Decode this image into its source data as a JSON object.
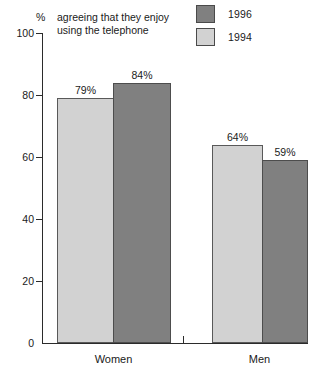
{
  "chart_data": {
    "type": "bar",
    "title": "",
    "caption": "agreeing that they enjoy using the telephone",
    "caption_line1": "agreeing that they enjoy",
    "caption_line2": "using the telephone",
    "unit_symbol": "%",
    "xlabel": "",
    "ylabel": "%",
    "ylim": [
      0,
      100
    ],
    "yticks": [
      0,
      20,
      40,
      60,
      80,
      100
    ],
    "ytick_labels": [
      "0",
      "20",
      "40",
      "60",
      "80",
      "100"
    ],
    "grid": false,
    "legend_position": "top-right",
    "categories": [
      "Women",
      "Men"
    ],
    "series": [
      {
        "name": "1994",
        "color": "#d2d2d2",
        "values": [
          79,
          64
        ],
        "labels": [
          "79%",
          "64%"
        ]
      },
      {
        "name": "1996",
        "color": "#808080",
        "values": [
          84,
          59
        ],
        "labels": [
          "84%",
          "59%"
        ]
      }
    ]
  },
  "legend": {
    "items": [
      {
        "label": "1996",
        "color": "#808080"
      },
      {
        "label": "1994",
        "color": "#d2d2d2"
      }
    ]
  },
  "axis": {
    "y_labels": [
      "100",
      "80",
      "60",
      "40",
      "20",
      "0"
    ],
    "x_labels": [
      "Women",
      "Men"
    ]
  },
  "values": {
    "women_1994": "79%",
    "women_1996": "84%",
    "men_1994": "64%",
    "men_1996": "59%"
  }
}
